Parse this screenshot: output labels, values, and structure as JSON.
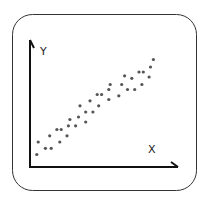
{
  "chart_data": {
    "type": "scatter",
    "title": "",
    "xlabel": "X",
    "ylabel": "Y",
    "grid": false,
    "legend": null,
    "xlim": [
      0,
      100
    ],
    "ylim": [
      0,
      100
    ],
    "points": [
      [
        4,
        10
      ],
      [
        5,
        20
      ],
      [
        10,
        15
      ],
      [
        13,
        25
      ],
      [
        14,
        15
      ],
      [
        18,
        30
      ],
      [
        20,
        20
      ],
      [
        21,
        30
      ],
      [
        25,
        25
      ],
      [
        26,
        33
      ],
      [
        27,
        38
      ],
      [
        31,
        33
      ],
      [
        33,
        40
      ],
      [
        34,
        49
      ],
      [
        38,
        36
      ],
      [
        38,
        44
      ],
      [
        41,
        53
      ],
      [
        43,
        44
      ],
      [
        46,
        58
      ],
      [
        47,
        49
      ],
      [
        49,
        58
      ],
      [
        54,
        54
      ],
      [
        54,
        62
      ],
      [
        55,
        66
      ],
      [
        61,
        57
      ],
      [
        63,
        66
      ],
      [
        65,
        73
      ],
      [
        67,
        62
      ],
      [
        70,
        71
      ],
      [
        72,
        62
      ],
      [
        75,
        76
      ],
      [
        77,
        66
      ],
      [
        78,
        76
      ],
      [
        82,
        72
      ],
      [
        83,
        80
      ],
      [
        85,
        86
      ]
    ],
    "point_color": "#555555"
  },
  "icon": {
    "frame_color": "#333333",
    "axis_color": "#111111"
  }
}
